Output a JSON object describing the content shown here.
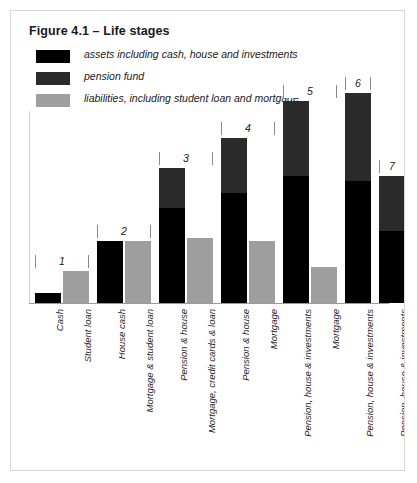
{
  "figure": {
    "title": "Figure 4.1 – Life stages",
    "border_color": "#d6d6d6",
    "background": "#ffffff"
  },
  "legend": {
    "position": "top-left",
    "items": [
      {
        "label": "assets including cash, house and investments",
        "color": "#000000",
        "swatch_name": "legend-swatch-assets"
      },
      {
        "label": "pension fund",
        "color": "#2b2b2b",
        "swatch_name": "legend-swatch-pension"
      },
      {
        "label": "liabilities, including student loan and mortgage",
        "color": "#9e9e9e",
        "swatch_name": "legend-swatch-liabilities"
      }
    ]
  },
  "colors": {
    "assets": "#000000",
    "pension": "#2b2b2b",
    "liabilities": "#9e9e9e",
    "axis": "#9a9a9a",
    "bracket": "#8a8a8a",
    "text": "#1a1a1a"
  },
  "group_brackets": [
    {
      "number": "1",
      "left": 22,
      "width": 62
    },
    {
      "number": "2",
      "left": 88,
      "width": 62
    },
    {
      "number": "3",
      "left": 154,
      "width": 62
    },
    {
      "number": "4",
      "left": 196,
      "width": 62
    },
    {
      "number": "5",
      "left": 254,
      "width": 62
    },
    {
      "number": "6",
      "left": 306,
      "width": 38
    },
    {
      "number": "7",
      "left": 346,
      "width": 38
    }
  ],
  "chart_data": {
    "type": "bar",
    "title": "Figure 4.1 – Life stages",
    "xlabel": "",
    "ylabel": "",
    "grid": false,
    "legend_position": "top-left",
    "stacked": true,
    "axis_values_shown": false,
    "series": [
      {
        "name": "assets including cash, house and investments",
        "color": "#000000"
      },
      {
        "name": "pension fund",
        "color": "#2b2b2b"
      },
      {
        "name": "liabilities, including student loan and mortgage",
        "color": "#9e9e9e"
      }
    ],
    "groups": [
      {
        "number": "1",
        "bars": [
          {
            "label": "Cash",
            "type": "asset",
            "assets": 10,
            "pension": 0
          },
          {
            "label": "Student loan",
            "type": "liability",
            "liabilities": 32
          }
        ]
      },
      {
        "number": "2",
        "bars": [
          {
            "label": "House cash",
            "type": "asset",
            "assets": 62,
            "pension": 0
          },
          {
            "label": "Mortgage & student loan",
            "type": "liability",
            "liabilities": 62
          }
        ]
      },
      {
        "number": "3",
        "bars": [
          {
            "label": "Pension & house",
            "type": "asset",
            "assets": 95,
            "pension": 40
          },
          {
            "label": "Mortgage, credit cards & loan",
            "type": "liability",
            "liabilities": 65
          }
        ]
      },
      {
        "number": "4",
        "bars": [
          {
            "label": "Pension & house",
            "type": "asset",
            "assets": 110,
            "pension": 55
          },
          {
            "label": "Mortgage",
            "type": "liability",
            "liabilities": 62
          }
        ]
      },
      {
        "number": "5",
        "bars": [
          {
            "label": "Pension, house & investments",
            "type": "asset",
            "assets": 127,
            "pension": 75
          },
          {
            "label": "Mortgage",
            "type": "liability",
            "liabilities": 36
          }
        ]
      },
      {
        "number": "6",
        "bars": [
          {
            "label": "Pension, house & investments",
            "type": "asset",
            "assets": 122,
            "pension": 88
          }
        ]
      },
      {
        "number": "7",
        "bars": [
          {
            "label": "Pension, house & investments",
            "type": "asset",
            "assets": 72,
            "pension": 55
          }
        ]
      }
    ]
  }
}
